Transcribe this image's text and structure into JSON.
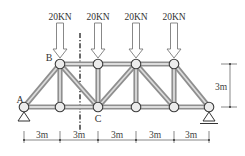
{
  "diagram": {
    "type": "truss",
    "loads": [
      {
        "label": "20KN",
        "node": "top-1"
      },
      {
        "label": "20KN",
        "node": "top-2"
      },
      {
        "label": "20KN",
        "node": "top-3"
      },
      {
        "label": "20KN",
        "node": "top-4"
      }
    ],
    "node_labels": {
      "a": "A",
      "b": "B",
      "c": "C"
    },
    "height_dimension": "3m",
    "span_dimensions": [
      "3m",
      "3m",
      "3m",
      "3m",
      "3m"
    ],
    "colors": {
      "member_outer": "#8f8f8f",
      "member_inner": "#dcdcdc",
      "node_stroke": "#3c3c3c",
      "section_line": "#2c2c2c"
    }
  }
}
